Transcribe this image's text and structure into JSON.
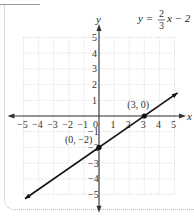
{
  "chart_data": {
    "type": "line",
    "equation": {
      "lhs": "y =",
      "num": "2",
      "den": "3",
      "rhs": "x − 2"
    },
    "xlabel": "x",
    "ylabel": "y",
    "xlim": [
      -5,
      5
    ],
    "ylim": [
      -5,
      5
    ],
    "grid": true,
    "x_ticks": [
      "−5",
      "−4",
      "−3",
      "−2",
      "−1",
      "0",
      "1",
      "2",
      "3",
      "4",
      "5"
    ],
    "y_ticks": [
      "5",
      "4",
      "3",
      "2",
      "1",
      "−1",
      "−2",
      "−3",
      "−4",
      "−5"
    ],
    "series": [
      {
        "name": "y = 2/3x − 2",
        "slope": 0.6667,
        "intercept": -2,
        "x": [
          -4.9,
          5.2
        ],
        "y": [
          -5.27,
          1.47
        ]
      }
    ],
    "points": [
      {
        "label": "(3, 0)",
        "x": 3,
        "y": 0
      },
      {
        "label": "(0, −2)",
        "x": 0,
        "y": -2
      }
    ]
  }
}
